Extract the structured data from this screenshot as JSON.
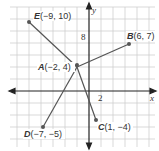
{
  "diagram": {
    "axes": {
      "x_label": "x",
      "y_label": "y",
      "x_tick": "2",
      "y_tick": "8"
    },
    "center": {
      "name": "A",
      "coords": "(−2, 4)"
    },
    "points": [
      {
        "name": "E",
        "coords": "(−9, 10)"
      },
      {
        "name": "B",
        "coords": "(6, 7)"
      },
      {
        "name": "A",
        "coords": "(−2, 4)"
      },
      {
        "name": "D",
        "coords": "(−7, −5)"
      },
      {
        "name": "C",
        "coords": "(1, −4)"
      }
    ],
    "colors": {
      "grid": "#c8c8c8",
      "axis": "#222222",
      "segment": "#555555",
      "point": "#555555"
    }
  }
}
